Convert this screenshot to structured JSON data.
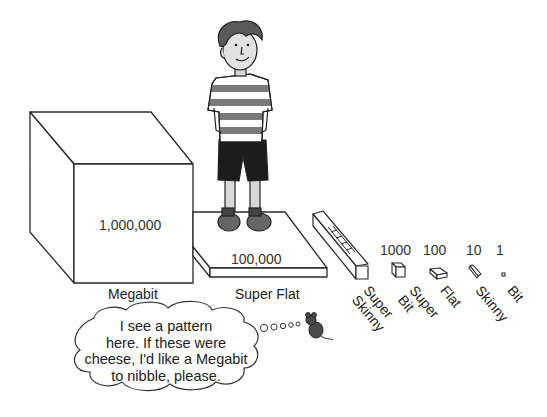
{
  "figure": {
    "pieces": [
      {
        "name": "Megabit",
        "value": "1,000,000"
      },
      {
        "name": "Super Flat",
        "value": "100,000"
      },
      {
        "name": "Super Skinny",
        "value": "10,000"
      },
      {
        "name": "Super Bit",
        "value": "1000"
      },
      {
        "name": "Flat",
        "value": "100"
      },
      {
        "name": "Skinny",
        "value": "10"
      },
      {
        "name": "Bit",
        "value": "1"
      }
    ],
    "labels": {
      "megabit": "Megabit",
      "super_flat": "Super Flat",
      "super_skinny_line1": "Super",
      "super_skinny_line2": "Skinny",
      "super_bit_line1": "Super",
      "super_bit_line2": "Bit",
      "flat": "Flat",
      "skinny": "Skinny",
      "bit": "Bit"
    },
    "values": {
      "megabit": "1,000,000",
      "super_flat": "100,000",
      "super_bit": "1000",
      "flat": "100",
      "skinny": "10",
      "bit": "1"
    },
    "thought_bubble": {
      "line1": "I see a pattern",
      "line2": "here. If these were",
      "line3": "cheese, I'd like a Megabit",
      "line4": "to nibble, please."
    },
    "colors": {
      "outline": "#2a2a2a",
      "shirt_stripe": "#7a7a7a",
      "shorts": "#1c1c1c",
      "mouse": "#4a4a4a"
    }
  }
}
